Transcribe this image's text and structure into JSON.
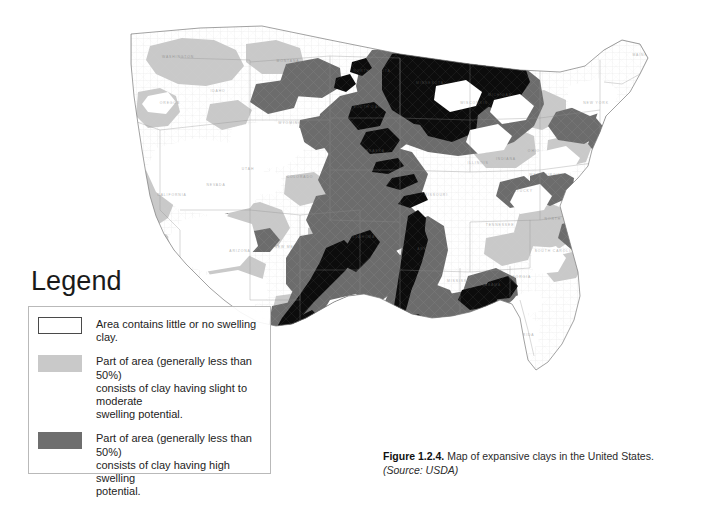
{
  "figure": {
    "number": "Figure 1.2.4.",
    "text": "Map of expansive clays in the United States.",
    "source": "(Source: USDA)"
  },
  "legend": {
    "title": "Legend",
    "items": [
      {
        "swatch": "white-no-clay-swatch",
        "color": "#ffffff",
        "label": "Area contains little or no swelling clay."
      },
      {
        "swatch": "light-gray-slight-moderate-swatch",
        "color": "#c9c9c9",
        "label": "Part of area (generally less than 50%)\nconsists of clay having slight to moderate\nswelling potential."
      },
      {
        "swatch": "mid-gray-high-swatch",
        "color": "#6e6e6e",
        "label": "Part of area (generally less than 50%)\nconsists of clay having high swelling\npotential."
      },
      {
        "swatch": "black-abundant-swatch",
        "color": "#0d0d0d",
        "label": "Area contains abundant clay having\nhigh swelling potential"
      }
    ]
  },
  "map": {
    "title": "Map of expansive clays in the United States",
    "region": "Conterminous United States",
    "background": "#ffffff",
    "state_outline_color": "#8d8d8d",
    "classes": {
      "none": "#ffffff",
      "slight_moderate": "#c9c9c9",
      "high": "#6e6e6e",
      "abundant": "#0d0d0d"
    },
    "state_labels": [
      "WASHINGTON",
      "OREGON",
      "CALIFORNIA",
      "NEVADA",
      "IDAHO",
      "MONTANA",
      "WYOMING",
      "UTAH",
      "ARIZONA",
      "COLORADO",
      "NEW MEXICO",
      "NORTH DAKOTA",
      "SOUTH DAKOTA",
      "NEBRASKA",
      "KANSAS",
      "OKLAHOMA",
      "TEXAS",
      "MINNESOTA",
      "IOWA",
      "MISSOURI",
      "ARKANSAS",
      "LOUISIANA",
      "WISCONSIN",
      "ILLINOIS",
      "MICHIGAN",
      "INDIANA",
      "OHIO",
      "KENTUCKY",
      "TENNESSEE",
      "MISSISSIPPI",
      "ALABAMA",
      "GEORGIA",
      "FLORIDA",
      "SOUTH CAROLINA",
      "NORTH CAROLINA",
      "VIRGINIA",
      "WEST VIRGINIA",
      "PENNSYLVANIA",
      "NEW YORK",
      "MAINE",
      "VERMONT",
      "NEW HAMPSHIRE",
      "MASSACHUSETTS",
      "MARYLAND",
      "NEW JERSEY"
    ],
    "notable_regions": [
      {
        "name": "dakotas-pierre-shale",
        "class": "abundant"
      },
      {
        "name": "great-plains-high",
        "class": "high"
      },
      {
        "name": "texas-gulf-coast-black",
        "class": "abundant"
      },
      {
        "name": "mississippi-embayment",
        "class": "high"
      },
      {
        "name": "black-belt-alabama",
        "class": "abundant"
      },
      {
        "name": "great-basin-none",
        "class": "none"
      },
      {
        "name": "appalachian-none",
        "class": "none"
      },
      {
        "name": "florida-peninsula-none",
        "class": "none"
      }
    ]
  }
}
